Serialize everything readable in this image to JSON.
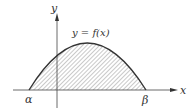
{
  "figure": {
    "curve_label": "y = f(x)",
    "x_axis_label": "x",
    "y_axis_label": "y",
    "left_root_label": "α",
    "right_root_label": "β",
    "colors": {
      "ink": "#333333",
      "hatch": "#666666",
      "background": "#ffffff"
    }
  }
}
